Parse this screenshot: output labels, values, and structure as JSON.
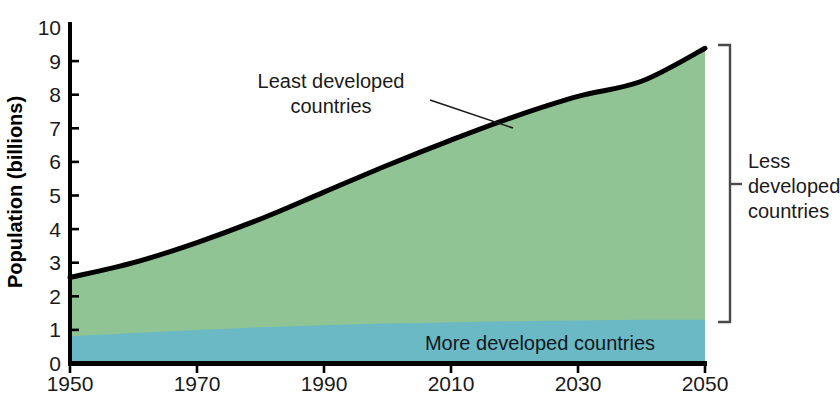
{
  "chart_data": {
    "type": "area",
    "title": "",
    "subtitle": "",
    "xlabel": "",
    "ylabel": "Population (billions)",
    "xlim": [
      1950,
      2050
    ],
    "ylim": [
      0,
      10
    ],
    "grid": false,
    "legend_position": "inline-annotations",
    "xticks": [
      "1950",
      "1970",
      "1990",
      "2010",
      "2030",
      "2050"
    ],
    "xtick_values": [
      1950,
      1970,
      1990,
      2010,
      2030,
      2050
    ],
    "yticks": [
      "0",
      "1",
      "2",
      "3",
      "4",
      "5",
      "6",
      "7",
      "8",
      "9",
      "10"
    ],
    "ytick_values": [
      0,
      1,
      2,
      3,
      4,
      5,
      6,
      7,
      8,
      9,
      10
    ],
    "x": [
      1950,
      1960,
      1970,
      1980,
      1990,
      2000,
      2010,
      2020,
      2030,
      2040,
      2050
    ],
    "stacked": true,
    "series": [
      {
        "name": "More developed countries",
        "color": "#6bb9c4",
        "values": [
          0.81,
          0.91,
          1.0,
          1.08,
          1.14,
          1.19,
          1.23,
          1.26,
          1.28,
          1.3,
          1.3
        ]
      },
      {
        "name": "Less developed countries (excluding least developed)",
        "color": "#d6ecd8",
        "values": [
          1.55,
          1.84,
          2.28,
          2.8,
          3.4,
          3.95,
          4.42,
          4.85,
          5.2,
          5.45,
          6.25
        ]
      },
      {
        "name": "Least developed countries",
        "color": "#90c494",
        "values": [
          0.2,
          0.25,
          0.32,
          0.42,
          0.56,
          0.76,
          1.0,
          1.24,
          1.47,
          1.65,
          1.83
        ]
      }
    ],
    "totals": [
      2.56,
      3.0,
      3.6,
      4.3,
      5.1,
      5.9,
      6.65,
      7.35,
      7.95,
      8.4,
      9.38
    ],
    "totals_note": "World population total, outlined by heavy black line"
  },
  "annotations": {
    "least_developed": {
      "line1": "Least developed",
      "line2": "countries",
      "leader": "diagonal leader line pointing to the upper green band"
    },
    "more_developed": {
      "label": "More developed countries"
    },
    "less_developed": {
      "line1": "Less",
      "line2": "developed",
      "line3": "countries",
      "bracket": "right-side vertical bracket spanning the two green bands"
    }
  },
  "colors": {
    "more_developed": "#6bb9c4",
    "less_developed_mid": "#d6ecd8",
    "least_developed": "#90c494",
    "outline": "#000000",
    "axis": "#000000",
    "text": "#1a1a1a",
    "background": "#ffffff"
  }
}
